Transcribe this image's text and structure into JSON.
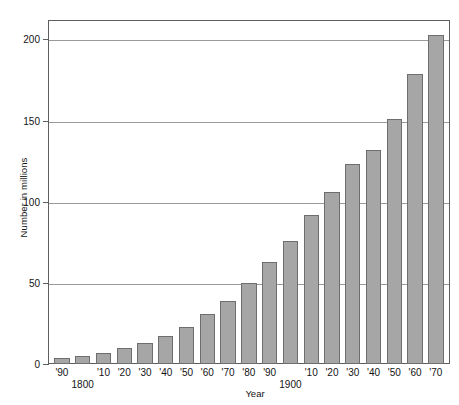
{
  "chart_data": {
    "type": "bar",
    "title": "",
    "xlabel": "Year",
    "ylabel": "Number in millions",
    "ylim": [
      0,
      212
    ],
    "yticks": [
      0,
      50,
      100,
      150,
      200
    ],
    "ytick_labels": [
      "0",
      "50",
      "100",
      "150",
      "200"
    ],
    "grid": "horizontal",
    "legend": "none",
    "categories": [
      "'90",
      "1800",
      "'10",
      "'20",
      "'30",
      "'40",
      "'50",
      "'60",
      "'70",
      "'80",
      "'90",
      "1900",
      "'10",
      "'20",
      "'30",
      "'40",
      "'50",
      "'60",
      "'70"
    ],
    "tick_labels": [
      "'90",
      "",
      "'10",
      "'20",
      "'30",
      "'40",
      "'50",
      "'60",
      "'70",
      "'80",
      "'90",
      "",
      "'10",
      "'20",
      "'30",
      "'40",
      "'50",
      "'60",
      "'70"
    ],
    "century_labels": [
      {
        "index": 1,
        "text": "1800"
      },
      {
        "index": 11,
        "text": "1900"
      }
    ],
    "values": [
      4,
      5,
      7,
      10,
      13,
      17,
      23,
      31,
      39,
      50,
      63,
      76,
      92,
      106,
      123,
      132,
      151,
      179,
      203
    ],
    "bar_color": "#a6a6a6",
    "bar_edge_color": "#6e6e6e",
    "grid_color": "#9a9a9a",
    "axis_color": "#5e5e5e"
  }
}
